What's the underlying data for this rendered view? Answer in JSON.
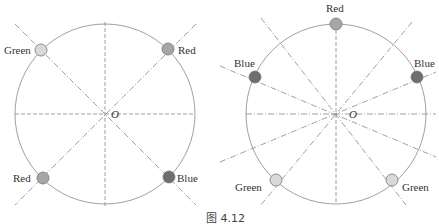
{
  "figure": {
    "caption": "图 4.12",
    "left": {
      "center_label": "O",
      "points": [
        {
          "label": "Green",
          "color": "#d9d9d9",
          "angle_deg": 135
        },
        {
          "label": "Red",
          "color": "#a6a6a6",
          "angle_deg": 45
        },
        {
          "label": "Red",
          "color": "#a6a6a6",
          "angle_deg": 225
        },
        {
          "label": "Blue",
          "color": "#6e6e6e",
          "angle_deg": 315
        }
      ]
    },
    "right": {
      "center_label": "O",
      "points": [
        {
          "label": "Red",
          "color": "#a6a6a6",
          "angle_deg": 90
        },
        {
          "label": "Blue",
          "color": "#6e6e6e",
          "angle_deg": 150
        },
        {
          "label": "Blue",
          "color": "#6e6e6e",
          "angle_deg": 30
        },
        {
          "label": "Green",
          "color": "#d9d9d9",
          "angle_deg": 240
        },
        {
          "label": "Green",
          "color": "#d9d9d9",
          "angle_deg": 300
        }
      ]
    }
  }
}
